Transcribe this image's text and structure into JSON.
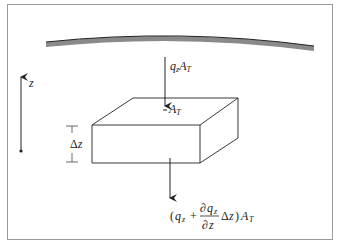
{
  "diagram": {
    "type": "control-volume flux diagram",
    "labels": {
      "z_axis": "z",
      "top_flux": {
        "base": "q",
        "sub": "z",
        "area": "A",
        "area_sub": "T"
      },
      "top_face_area": {
        "base": "A",
        "sub": "T"
      },
      "thickness": {
        "delta": "Δ",
        "var": "z"
      },
      "bottom_flux": {
        "open": "(",
        "q": "q",
        "q_sub": "z",
        "plus": "+",
        "num_partial": "∂",
        "num_q": "q",
        "num_sub": "z",
        "den_partial": "∂",
        "den_var": "z",
        "delta": "Δ",
        "dz": "z",
        "close": ")",
        "area": "A",
        "area_sub": "T"
      }
    },
    "colors": {
      "border": "#9a9a9a",
      "surface": "#8a8a8a",
      "line": "#222222"
    }
  }
}
